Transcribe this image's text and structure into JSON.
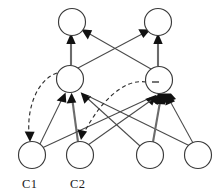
{
  "figure": {
    "kind": "directed-graph-diagram",
    "background_color": "#ffffff",
    "line_color": "#4a4a4a",
    "arrow_color": "#111111",
    "dashed_color": "#2f2f2f",
    "node_stroke_color": "#3a3a3a",
    "node_fill_color": "#ffffff",
    "label_color": "#1a1a1a"
  },
  "nodes": [
    {
      "id": "top-left",
      "cx": 72,
      "cy": 22,
      "r": 13.5,
      "label": "",
      "mark": "none"
    },
    {
      "id": "top-right",
      "cx": 158,
      "cy": 22,
      "r": 13.5,
      "label": "",
      "mark": "none"
    },
    {
      "id": "mid-left",
      "cx": 70,
      "cy": 79,
      "r": 13.5,
      "label": "",
      "mark": "none"
    },
    {
      "id": "mid-right",
      "cx": 159,
      "cy": 80,
      "r": 13.5,
      "label": "",
      "mark": "minus"
    },
    {
      "id": "bottom-c1",
      "cx": 32,
      "cy": 155,
      "r": 13.5,
      "label": "C1",
      "mark": "none"
    },
    {
      "id": "bottom-c2",
      "cx": 80,
      "cy": 155,
      "r": 13.5,
      "label": "C2",
      "mark": "none"
    },
    {
      "id": "bottom-three",
      "cx": 150,
      "cy": 155,
      "r": 13.5,
      "label": "",
      "mark": "none"
    },
    {
      "id": "bottom-four",
      "cx": 198,
      "cy": 155,
      "r": 13.5,
      "label": "",
      "mark": "none"
    }
  ],
  "labels": [
    {
      "text": "C1",
      "x": 28,
      "y": 184
    },
    {
      "text": "C2",
      "x": 76,
      "y": 184
    }
  ],
  "edges": [
    {
      "from": "mid-left",
      "to": "top-left",
      "style": "thick-solid",
      "arrow": "end"
    },
    {
      "from": "mid-right",
      "to": "top-right",
      "style": "thick-solid",
      "arrow": "end"
    },
    {
      "from": "mid-left",
      "to": "top-right",
      "style": "solid",
      "arrow": "end"
    },
    {
      "from": "mid-right",
      "to": "top-left",
      "style": "solid",
      "arrow": "end"
    },
    {
      "from": "bottom-c1",
      "to": "mid-left",
      "style": "solid",
      "arrow": "end"
    },
    {
      "from": "bottom-c2",
      "to": "mid-left",
      "style": "thick-solid",
      "arrow": "end"
    },
    {
      "from": "bottom-three",
      "to": "mid-left",
      "style": "solid",
      "arrow": "end"
    },
    {
      "from": "bottom-four",
      "to": "mid-left",
      "style": "solid",
      "arrow": "end"
    },
    {
      "from": "bottom-c1",
      "to": "mid-right",
      "style": "solid",
      "arrow": "end"
    },
    {
      "from": "bottom-c2",
      "to": "mid-right",
      "style": "solid",
      "arrow": "end"
    },
    {
      "from": "bottom-three",
      "to": "mid-right",
      "style": "thick-solid",
      "arrow": "end"
    },
    {
      "from": "bottom-four",
      "to": "mid-right",
      "style": "solid",
      "arrow": "end"
    },
    {
      "from": "mid-left",
      "to": "bottom-c1",
      "style": "dashed-curve",
      "arrow": "end"
    },
    {
      "from": "mid-right",
      "to": "bottom-c2",
      "style": "dashed-curve",
      "arrow": "end"
    }
  ],
  "summary": {
    "node_count": 8,
    "layer_count": 3,
    "dashed_edge_count": 2,
    "labeled_node_count": 2
  }
}
